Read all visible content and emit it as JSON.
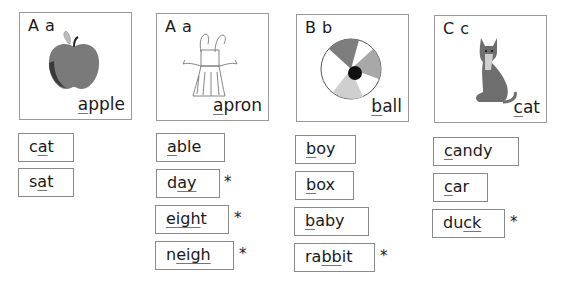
{
  "cards": [
    {
      "letters": "A a",
      "word_pre": "",
      "word_key": "a",
      "word_post": "pple",
      "picture": "apple"
    },
    {
      "letters": "A a",
      "word_pre": "",
      "word_key": "a",
      "word_post": "pron",
      "picture": "apron"
    },
    {
      "letters": "B b",
      "word_pre": "",
      "word_key": "b",
      "word_post": "all",
      "picture": "ball"
    },
    {
      "letters": "C c",
      "word_pre": "",
      "word_key": "c",
      "word_post": "at",
      "picture": "cat"
    }
  ],
  "columns": [
    {
      "words": [
        {
          "pre": "c",
          "key": "a",
          "post": "t",
          "star": ""
        },
        {
          "pre": "s",
          "key": "a",
          "post": "t",
          "star": ""
        }
      ]
    },
    {
      "words": [
        {
          "pre": "",
          "key": "a",
          "post": "ble",
          "star": ""
        },
        {
          "pre": "d",
          "key": "ay",
          "post": "",
          "star": "*"
        },
        {
          "pre": "",
          "key": "eigh",
          "post": "t",
          "star": "*"
        },
        {
          "pre": "n",
          "key": "eigh",
          "post": "",
          "star": "*"
        }
      ]
    },
    {
      "words": [
        {
          "pre": "",
          "key": "b",
          "post": "oy",
          "star": ""
        },
        {
          "pre": "",
          "key": "b",
          "post": "ox",
          "star": ""
        },
        {
          "pre": "",
          "key": "b",
          "post": "aby",
          "star": ""
        },
        {
          "pre": "ra",
          "key": "bb",
          "post": "it",
          "star": "*"
        }
      ]
    },
    {
      "words": [
        {
          "pre": "",
          "key": "c",
          "post": "andy",
          "star": ""
        },
        {
          "pre": "",
          "key": "c",
          "post": "ar",
          "star": ""
        },
        {
          "pre": "du",
          "key": "ck",
          "post": "",
          "star": "*"
        }
      ]
    }
  ]
}
